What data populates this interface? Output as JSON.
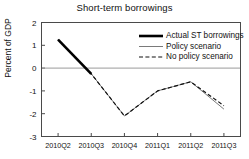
{
  "chart_data": {
    "type": "line",
    "title": "Short-term borrowings",
    "xlabel": "",
    "ylabel": "Percent of GDP",
    "categories": [
      "2010Q2",
      "2010Q3",
      "2010Q4",
      "2011Q1",
      "2011Q2",
      "2011Q3"
    ],
    "ylim": [
      -3,
      2
    ],
    "yticks": [
      2,
      1,
      0,
      -1,
      -2,
      -3
    ],
    "ytick_labels": [
      "2",
      "1",
      "0",
      "-1",
      "-2",
      "-3"
    ],
    "grid": false,
    "zero_line": true,
    "legend_position": "top-right",
    "series": [
      {
        "name": "Actual ST borrowings",
        "style": "solid-thick",
        "color": "#000000",
        "x": [
          "2010Q2",
          "2010Q3"
        ],
        "values": [
          1.25,
          -0.25
        ]
      },
      {
        "name": "Policy scenario",
        "style": "solid-thin",
        "color": "#7a7a7a",
        "x": [
          "2010Q2",
          "2010Q3",
          "2010Q4",
          "2011Q1",
          "2011Q2",
          "2011Q3"
        ],
        "values": [
          1.25,
          -0.25,
          -2.1,
          -1.0,
          -0.6,
          -1.8
        ]
      },
      {
        "name": "No policy scenario",
        "style": "dashed",
        "color": "#111111",
        "x": [
          "2010Q2",
          "2010Q3",
          "2010Q4",
          "2011Q1",
          "2011Q2",
          "2011Q3"
        ],
        "values": [
          1.25,
          -0.25,
          -2.1,
          -1.0,
          -0.6,
          -1.65
        ]
      }
    ]
  },
  "legend": {
    "items": [
      {
        "label": "Actual ST borrowings"
      },
      {
        "label": "Policy scenario"
      },
      {
        "label": "No policy scenario"
      }
    ]
  }
}
